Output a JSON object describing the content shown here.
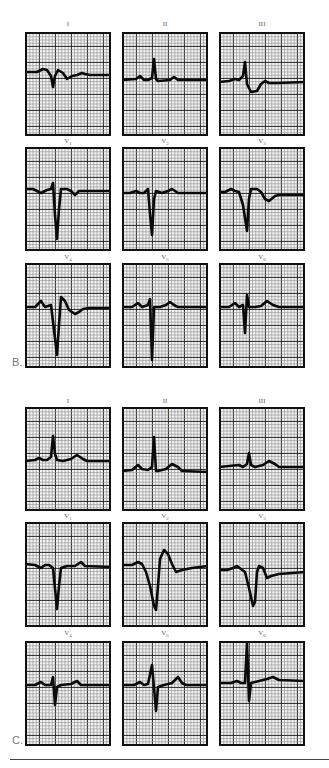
{
  "figure": {
    "panels_B": {
      "label": "B.",
      "leads": [
        {
          "name": "I",
          "sub": "",
          "trace": [
            [
              0,
              38
            ],
            [
              12,
              38
            ],
            [
              18,
              35
            ],
            [
              22,
              36
            ],
            [
              26,
              42
            ],
            [
              28,
              53
            ],
            [
              30,
              42
            ],
            [
              33,
              36
            ],
            [
              38,
              39
            ],
            [
              42,
              45
            ],
            [
              47,
              42
            ],
            [
              52,
              41
            ],
            [
              57,
              39
            ],
            [
              60,
              40
            ],
            [
              65,
              41
            ],
            [
              86,
              41
            ]
          ]
        },
        {
          "name": "II",
          "sub": "",
          "trace": [
            [
              0,
              46
            ],
            [
              14,
              45
            ],
            [
              18,
              42
            ],
            [
              22,
              46
            ],
            [
              26,
              46
            ],
            [
              30,
              44
            ],
            [
              32,
              25
            ],
            [
              34,
              45
            ],
            [
              36,
              47
            ],
            [
              48,
              46
            ],
            [
              52,
              43
            ],
            [
              56,
              46
            ],
            [
              86,
              46
            ]
          ]
        },
        {
          "name": "III",
          "sub": "",
          "trace": [
            [
              0,
              48
            ],
            [
              10,
              47
            ],
            [
              16,
              45
            ],
            [
              20,
              46
            ],
            [
              24,
              42
            ],
            [
              26,
              28
            ],
            [
              28,
              50
            ],
            [
              32,
              58
            ],
            [
              38,
              57
            ],
            [
              42,
              50
            ],
            [
              46,
              47
            ],
            [
              50,
              49
            ],
            [
              58,
              49
            ],
            [
              86,
              48
            ]
          ]
        },
        {
          "name": "V",
          "sub": "1",
          "trace": [
            [
              0,
              40
            ],
            [
              8,
              40
            ],
            [
              12,
              42
            ],
            [
              16,
              44
            ],
            [
              22,
              41
            ],
            [
              26,
              40
            ],
            [
              28,
              34
            ],
            [
              30,
              66
            ],
            [
              32,
              90
            ],
            [
              34,
              60
            ],
            [
              36,
              40
            ],
            [
              42,
              40
            ],
            [
              46,
              42
            ],
            [
              50,
              46
            ],
            [
              54,
              42
            ],
            [
              60,
              42
            ],
            [
              86,
              42
            ]
          ]
        },
        {
          "name": "V",
          "sub": "2",
          "trace": [
            [
              0,
              44
            ],
            [
              8,
              44
            ],
            [
              14,
              42
            ],
            [
              18,
              44
            ],
            [
              22,
              44
            ],
            [
              26,
              40
            ],
            [
              28,
              65
            ],
            [
              30,
              86
            ],
            [
              32,
              50
            ],
            [
              34,
              42
            ],
            [
              40,
              44
            ],
            [
              46,
              42
            ],
            [
              50,
              40
            ],
            [
              56,
              44
            ],
            [
              86,
              44
            ]
          ]
        },
        {
          "name": "V",
          "sub": "3",
          "trace": [
            [
              0,
              43
            ],
            [
              6,
              43
            ],
            [
              12,
              40
            ],
            [
              16,
              42
            ],
            [
              20,
              43
            ],
            [
              24,
              56
            ],
            [
              28,
              82
            ],
            [
              30,
              50
            ],
            [
              32,
              40
            ],
            [
              38,
              40
            ],
            [
              42,
              43
            ],
            [
              46,
              50
            ],
            [
              50,
              52
            ],
            [
              56,
              47
            ],
            [
              60,
              46
            ],
            [
              86,
              46
            ]
          ]
        },
        {
          "name": "V",
          "sub": "4",
          "trace": [
            [
              0,
              42
            ],
            [
              10,
              42
            ],
            [
              16,
              36
            ],
            [
              20,
              42
            ],
            [
              26,
              40
            ],
            [
              32,
              90
            ],
            [
              34,
              60
            ],
            [
              36,
              32
            ],
            [
              40,
              36
            ],
            [
              44,
              45
            ],
            [
              50,
              49
            ],
            [
              54,
              47
            ],
            [
              58,
              44
            ],
            [
              64,
              43
            ],
            [
              86,
              43
            ]
          ]
        },
        {
          "name": "V",
          "sub": "5",
          "trace": [
            [
              0,
              42
            ],
            [
              10,
              42
            ],
            [
              16,
              38
            ],
            [
              20,
              42
            ],
            [
              26,
              40
            ],
            [
              28,
              34
            ],
            [
              30,
              95
            ],
            [
              32,
              42
            ],
            [
              38,
              42
            ],
            [
              44,
              40
            ],
            [
              48,
              37
            ],
            [
              52,
              40
            ],
            [
              56,
              42
            ],
            [
              86,
              42
            ]
          ]
        },
        {
          "name": "V",
          "sub": "6",
          "trace": [
            [
              0,
              42
            ],
            [
              10,
              42
            ],
            [
              16,
              38
            ],
            [
              20,
              42
            ],
            [
              24,
              40
            ],
            [
              26,
              68
            ],
            [
              28,
              30
            ],
            [
              30,
              42
            ],
            [
              36,
              42
            ],
            [
              42,
              41
            ],
            [
              48,
              36
            ],
            [
              54,
              40
            ],
            [
              60,
              42
            ],
            [
              86,
              42
            ]
          ]
        }
      ]
    },
    "panels_C": {
      "label": "C.",
      "leads": [
        {
          "name": "I",
          "sub": "",
          "trace": [
            [
              0,
              52
            ],
            [
              10,
              51
            ],
            [
              14,
              49
            ],
            [
              18,
              51
            ],
            [
              22,
              51
            ],
            [
              26,
              48
            ],
            [
              28,
              27
            ],
            [
              30,
              45
            ],
            [
              32,
              51
            ],
            [
              38,
              52
            ],
            [
              46,
              50
            ],
            [
              52,
              46
            ],
            [
              58,
              50
            ],
            [
              62,
              52
            ],
            [
              86,
              52
            ]
          ]
        },
        {
          "name": "II",
          "sub": "",
          "trace": [
            [
              0,
              62
            ],
            [
              10,
              61
            ],
            [
              16,
              56
            ],
            [
              20,
              60
            ],
            [
              26,
              61
            ],
            [
              30,
              58
            ],
            [
              32,
              28
            ],
            [
              34,
              62
            ],
            [
              36,
              62
            ],
            [
              44,
              60
            ],
            [
              50,
              55
            ],
            [
              56,
              58
            ],
            [
              60,
              62
            ],
            [
              86,
              63
            ]
          ]
        },
        {
          "name": "III",
          "sub": "",
          "trace": [
            [
              0,
              58
            ],
            [
              10,
              57
            ],
            [
              20,
              56
            ],
            [
              24,
              58
            ],
            [
              28,
              55
            ],
            [
              30,
              44
            ],
            [
              32,
              56
            ],
            [
              36,
              58
            ],
            [
              44,
              56
            ],
            [
              50,
              52
            ],
            [
              56,
              55
            ],
            [
              60,
              58
            ],
            [
              86,
              58
            ]
          ]
        },
        {
          "name": "V",
          "sub": "1",
          "trace": [
            [
              0,
              40
            ],
            [
              10,
              41
            ],
            [
              16,
              44
            ],
            [
              20,
              41
            ],
            [
              24,
              41
            ],
            [
              28,
              44
            ],
            [
              32,
              85
            ],
            [
              34,
              62
            ],
            [
              36,
              44
            ],
            [
              42,
              42
            ],
            [
              50,
              42
            ],
            [
              56,
              38
            ],
            [
              60,
              42
            ],
            [
              86,
              43
            ]
          ]
        },
        {
          "name": "V",
          "sub": "2",
          "trace": [
            [
              0,
              41
            ],
            [
              10,
              41
            ],
            [
              16,
              38
            ],
            [
              20,
              40
            ],
            [
              24,
              48
            ],
            [
              28,
              62
            ],
            [
              32,
              82
            ],
            [
              34,
              86
            ],
            [
              36,
              62
            ],
            [
              38,
              35
            ],
            [
              42,
              26
            ],
            [
              46,
              30
            ],
            [
              50,
              40
            ],
            [
              54,
              48
            ],
            [
              60,
              46
            ],
            [
              70,
              44
            ],
            [
              86,
              42
            ]
          ]
        },
        {
          "name": "V",
          "sub": "3",
          "trace": [
            [
              0,
              46
            ],
            [
              8,
              46
            ],
            [
              14,
              44
            ],
            [
              18,
              42
            ],
            [
              22,
              45
            ],
            [
              26,
              48
            ],
            [
              30,
              64
            ],
            [
              34,
              82
            ],
            [
              36,
              78
            ],
            [
              38,
              48
            ],
            [
              40,
              42
            ],
            [
              44,
              44
            ],
            [
              48,
              54
            ],
            [
              52,
              52
            ],
            [
              60,
              50
            ],
            [
              86,
              48
            ]
          ]
        },
        {
          "name": "V",
          "sub": "4",
          "trace": [
            [
              0,
              42
            ],
            [
              10,
              42
            ],
            [
              16,
              39
            ],
            [
              20,
              42
            ],
            [
              26,
              42
            ],
            [
              28,
              34
            ],
            [
              30,
              62
            ],
            [
              32,
              44
            ],
            [
              36,
              42
            ],
            [
              46,
              41
            ],
            [
              52,
              38
            ],
            [
              56,
              42
            ],
            [
              86,
              42
            ]
          ]
        },
        {
          "name": "V",
          "sub": "5",
          "trace": [
            [
              0,
              42
            ],
            [
              12,
              42
            ],
            [
              18,
              39
            ],
            [
              22,
              42
            ],
            [
              26,
              41
            ],
            [
              30,
              22
            ],
            [
              34,
              68
            ],
            [
              36,
              44
            ],
            [
              42,
              42
            ],
            [
              50,
              40
            ],
            [
              56,
              34
            ],
            [
              60,
              40
            ],
            [
              64,
              42
            ],
            [
              86,
              42
            ]
          ]
        },
        {
          "name": "V",
          "sub": "6",
          "trace": [
            [
              0,
              40
            ],
            [
              12,
              40
            ],
            [
              18,
              38
            ],
            [
              22,
              40
            ],
            [
              26,
              40
            ],
            [
              28,
              0
            ],
            [
              30,
              58
            ],
            [
              32,
              40
            ],
            [
              40,
              38
            ],
            [
              48,
              36
            ],
            [
              54,
              34
            ],
            [
              60,
              37
            ],
            [
              86,
              38
            ]
          ]
        }
      ]
    },
    "colors": {
      "grid_minor": "#8a8a8a",
      "grid_major": "#111111",
      "trace": "#0a0a0a",
      "paper": "#f4f4f4"
    }
  }
}
